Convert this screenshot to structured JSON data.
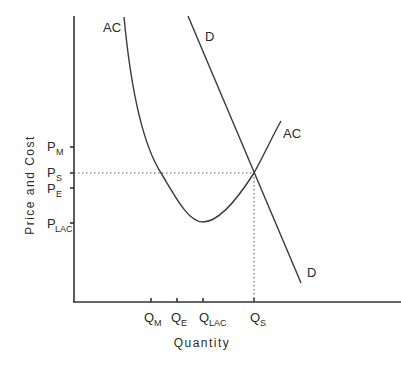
{
  "diagram": {
    "type": "economics-cost-demand",
    "axes": {
      "x_label": "Quantity",
      "y_label": "Price and Cost"
    },
    "curves": {
      "ac": {
        "label_top": "AC",
        "label_right": "AC"
      },
      "demand": {
        "label_top": "D",
        "label_bottom": "D"
      }
    },
    "y_ticks": [
      {
        "main": "P",
        "sub": "M"
      },
      {
        "main": "P",
        "sub": "S"
      },
      {
        "main": "P",
        "sub": "E"
      },
      {
        "main": "P",
        "sub": "LAC"
      }
    ],
    "x_ticks": [
      {
        "main": "Q",
        "sub": "M"
      },
      {
        "main": "Q",
        "sub": "E"
      },
      {
        "main": "Q",
        "sub": "LAC"
      },
      {
        "main": "Q",
        "sub": "S"
      }
    ]
  }
}
